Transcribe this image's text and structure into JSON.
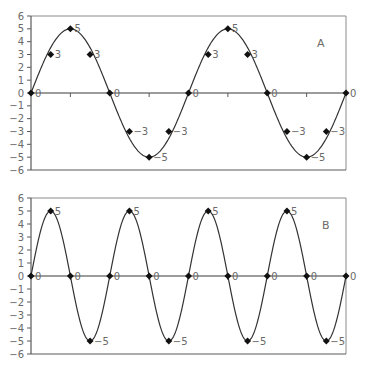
{
  "chart_data": [
    {
      "type": "line",
      "title": "",
      "panel_label": "A",
      "xlabel": "",
      "ylabel": "",
      "ylim": [
        -6,
        6
      ],
      "yticks": [
        6,
        5,
        4,
        3,
        2,
        1,
        0,
        -1,
        -2,
        -3,
        -4,
        -5,
        -6
      ],
      "grid": false,
      "legend": null,
      "x": [
        0,
        1,
        2,
        3,
        4,
        5,
        6,
        7,
        8,
        9,
        10,
        11,
        12,
        13,
        14,
        15,
        16
      ],
      "series": [
        {
          "name": "A",
          "values": [
            0,
            3,
            5,
            3,
            0,
            -3,
            -5,
            -3,
            0,
            3,
            5,
            3,
            0,
            -3,
            -5,
            -3,
            0
          ],
          "point_labels": [
            "0",
            "3",
            "5",
            "3",
            "0",
            "−3",
            "−5",
            "−3",
            "0",
            "3",
            "5",
            "3",
            "0",
            "−3",
            "−5",
            "−3",
            "0"
          ],
          "curve": "sine, 2 periods, amplitude 5"
        }
      ]
    },
    {
      "type": "line",
      "title": "",
      "panel_label": "B",
      "xlabel": "",
      "ylabel": "",
      "ylim": [
        -6,
        6
      ],
      "yticks": [
        6,
        5,
        4,
        3,
        2,
        1,
        0,
        -1,
        -2,
        -3,
        -4,
        -5,
        -6
      ],
      "grid": false,
      "legend": null,
      "x": [
        0,
        1,
        2,
        3,
        4,
        5,
        6,
        7,
        8,
        9,
        10,
        11,
        12,
        13,
        14,
        15,
        16
      ],
      "series": [
        {
          "name": "B",
          "values": [
            0,
            5,
            0,
            -5,
            0,
            5,
            0,
            -5,
            0,
            5,
            0,
            -5,
            0,
            5,
            0,
            -5,
            0
          ],
          "point_labels": [
            "0",
            "5",
            "0",
            "−5",
            "0",
            "5",
            "0",
            "−5",
            "0",
            "5",
            "0",
            "−5",
            "0",
            "5",
            "0",
            "−5",
            "0"
          ],
          "curve": "sine, 4 periods, amplitude 5"
        }
      ]
    }
  ],
  "panels": {
    "a": {
      "label": "A"
    },
    "b": {
      "label": "B"
    }
  }
}
